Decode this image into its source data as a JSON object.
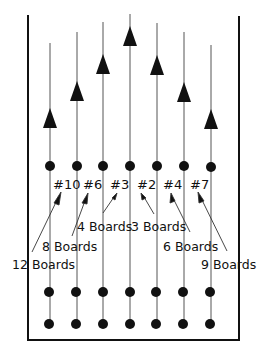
{
  "diagram": {
    "type": "bowling lane target diagram",
    "colors": {
      "ink": "#111111",
      "background": "#ffffff"
    },
    "pin_labels": [
      "#10",
      "#6",
      "#3",
      "#2",
      "#4",
      "#7"
    ],
    "board_labels": [
      "12 Boards",
      "8 Boards",
      "4 Boards",
      "3 Boards",
      "6 Boards",
      "9 Boards"
    ],
    "arrow_markers_count": 7,
    "dot_rows": 3,
    "lanes": 7
  }
}
